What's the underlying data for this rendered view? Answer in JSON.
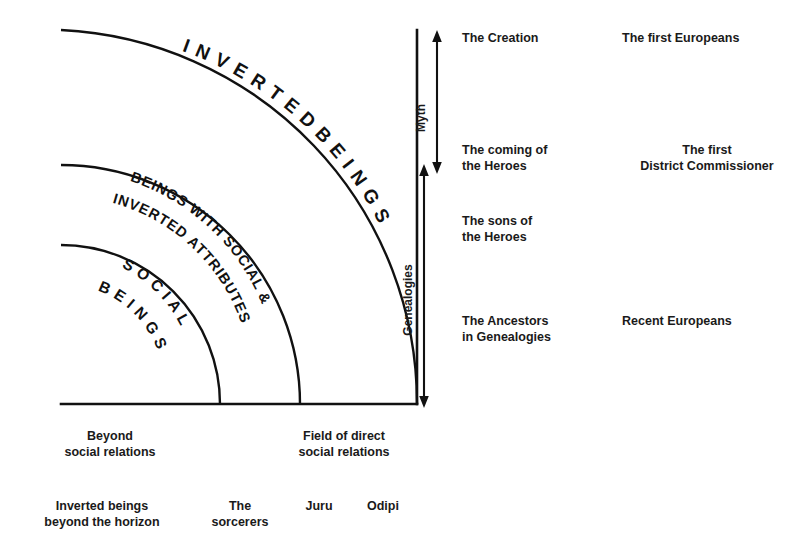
{
  "figure": {
    "background_color": "#ffffff",
    "ink_color": "#111111"
  },
  "zones": {
    "outer": {
      "label": "I N V E R T E D   B E I N G S"
    },
    "middle": {
      "label_line1": "BEINGS WITH SOCIAL &",
      "label_line2": "INVERTED ATTRIBUTES"
    },
    "inner": {
      "label_line1": "S O C I A L",
      "label_line2": "B E I N G S"
    }
  },
  "axes": {
    "myth": {
      "label": "Myth"
    },
    "genealogies": {
      "label": "Genealogies"
    }
  },
  "time_column": {
    "rows": [
      {
        "text": "The Creation"
      },
      {
        "text": "The coming of\nthe Heroes"
      },
      {
        "text": "The sons of\nthe Heroes"
      },
      {
        "text": "The Ancestors\nin Genealogies"
      }
    ]
  },
  "contact_column": {
    "rows": [
      {
        "text": "The first Europeans"
      },
      {
        "text": "The first\nDistrict Commissioner"
      },
      {
        "text": ""
      },
      {
        "text": "Recent Europeans"
      }
    ]
  },
  "bottom_domains": [
    {
      "text": "Beyond\nsocial relations"
    },
    {
      "text": "Field of direct\nsocial relations"
    }
  ],
  "bottom_categories": [
    {
      "text": "Inverted beings\nbeyond the horizon"
    },
    {
      "text": "The\nsorcerers"
    },
    {
      "text": "Juru"
    },
    {
      "text": "Odipi"
    }
  ]
}
